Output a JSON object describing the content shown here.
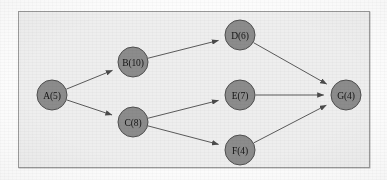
{
  "figure": {
    "kind": "directed-acyclic-graph",
    "caption": "",
    "frame": {
      "background_color": "#eeeeee",
      "border_color": "#9a9a9a",
      "page_color": "#fdfdfd"
    },
    "style": {
      "node_fill": "#8c8c8c",
      "node_stroke": "#4f4f4f",
      "edge_color": "#5a5a5a",
      "label_color": "#141414"
    }
  },
  "graph": {
    "nodes": [
      {
        "id": "A",
        "label": "A(5)",
        "name": "A",
        "weight": 5,
        "cx": 52,
        "cy": 95,
        "r": 15
      },
      {
        "id": "B",
        "label": "B(10)",
        "name": "B",
        "weight": 10,
        "cx": 133,
        "cy": 62,
        "r": 15
      },
      {
        "id": "C",
        "label": "C(8)",
        "name": "C",
        "weight": 8,
        "cx": 133,
        "cy": 122,
        "r": 15
      },
      {
        "id": "D",
        "label": "D(6)",
        "name": "D",
        "weight": 6,
        "cx": 240,
        "cy": 35,
        "r": 15
      },
      {
        "id": "E",
        "label": "E(7)",
        "name": "E",
        "weight": 7,
        "cx": 240,
        "cy": 95,
        "r": 15
      },
      {
        "id": "F",
        "label": "F(4)",
        "name": "F",
        "weight": 4,
        "cx": 240,
        "cy": 150,
        "r": 15
      },
      {
        "id": "G",
        "label": "G(4)",
        "name": "G",
        "weight": 4,
        "cx": 346,
        "cy": 95,
        "r": 15
      }
    ],
    "edges": [
      {
        "from": "A",
        "to": "B",
        "directed": true
      },
      {
        "from": "A",
        "to": "C",
        "directed": true
      },
      {
        "from": "B",
        "to": "D",
        "directed": true
      },
      {
        "from": "C",
        "to": "E",
        "directed": true
      },
      {
        "from": "C",
        "to": "F",
        "directed": true
      },
      {
        "from": "D",
        "to": "G",
        "directed": true
      },
      {
        "from": "E",
        "to": "G",
        "directed": true
      },
      {
        "from": "F",
        "to": "G",
        "directed": true
      }
    ]
  }
}
